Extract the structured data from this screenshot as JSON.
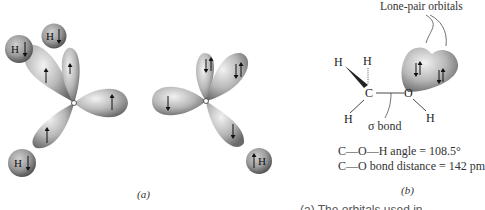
{
  "figure": {
    "panel_a": {
      "caption": "(a)",
      "left_atom": {
        "name": "carbon",
        "lobes": [
          {
            "direction": "upper-left",
            "electron": "up"
          },
          {
            "direction": "up",
            "electron": "up"
          },
          {
            "direction": "right",
            "electron": "up"
          },
          {
            "direction": "lower-left",
            "electron": "up"
          }
        ]
      },
      "hydrogens": [
        {
          "label": "H",
          "electron": "down"
        },
        {
          "label": "H",
          "electron": "down"
        },
        {
          "label": "H",
          "electron": "down"
        },
        {
          "label": "H",
          "electron": "up"
        }
      ],
      "right_atom": {
        "name": "oxygen",
        "lobes": [
          {
            "direction": "left",
            "electron": "down"
          },
          {
            "direction": "up",
            "electron": "down-up pair"
          },
          {
            "direction": "upper-right",
            "electron": "down-up pair"
          },
          {
            "direction": "lower-right",
            "electron": "down"
          }
        ]
      }
    },
    "panel_b": {
      "caption": "(b)",
      "lone_pair_label": "Lone-pair orbitals",
      "sigma_label": "σ bond",
      "atoms": {
        "C": "C",
        "O": "O",
        "H": "H"
      },
      "angle_text": "C—O—H angle = 108.5°",
      "distance_text": "C—O bond distance = 142 pm"
    },
    "bottom_text": "(a) The orbitals used in"
  },
  "colors": {
    "lobe_light": "#d8d8d8",
    "lobe_dark": "#6a6a6a",
    "arrow": "#111111",
    "text": "#333333"
  }
}
